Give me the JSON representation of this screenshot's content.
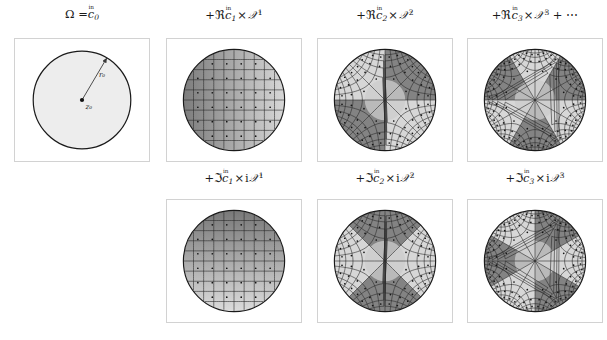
{
  "figure": {
    "background": "#ffffff",
    "panel_border_color": "#d2d2d2",
    "ink_color": "#1a1a1a"
  },
  "rows": [
    {
      "name": "real-part-row",
      "panels": [
        {
          "id": "omega-disk",
          "caption_parts": {
            "lead": "Ω =",
            "operator": "",
            "coefficient": "c",
            "coefficient_marker": "in",
            "coefficient_index": "0",
            "factor": "",
            "power": "",
            "trailer": ""
          },
          "caption_text": "Ω = c̊₀",
          "type": "domain",
          "annotations": {
            "center_label": "z₀",
            "radius_label": "r₀"
          },
          "fill": "#ededed",
          "grid": "none"
        },
        {
          "id": "re-c1-z1",
          "caption_text": "+ℜc̊₁ × 𝒵¹",
          "caption_parts": {
            "lead": "+",
            "operator": "ℜ",
            "coefficient": "c",
            "coefficient_marker": "in",
            "coefficient_index": "1",
            "factor": "",
            "power": "1",
            "trailer": ""
          },
          "type": "conformal",
          "order": 1,
          "imaginary": false,
          "gradient_direction": "horizontal",
          "gradient_dark": "#6e6e6e",
          "gradient_light": "#e6e6e6"
        },
        {
          "id": "re-c2-z2",
          "caption_text": "+ℜc̊₂ × 𝒵²",
          "caption_parts": {
            "lead": "+",
            "operator": "ℜ",
            "coefficient": "c",
            "coefficient_marker": "in",
            "coefficient_index": "2",
            "factor": "",
            "power": "2",
            "trailer": ""
          },
          "type": "conformal",
          "order": 2,
          "imaginary": false,
          "gradient_direction": "radial2",
          "gradient_dark": "#6e6e6e",
          "gradient_light": "#e6e6e6"
        },
        {
          "id": "re-c3-z3",
          "caption_text": "+ℜc̊₃ × 𝒵³ + ⋯",
          "caption_parts": {
            "lead": "+",
            "operator": "ℜ",
            "coefficient": "c",
            "coefficient_marker": "in",
            "coefficient_index": "3",
            "factor": "",
            "power": "3",
            "trailer": "+ ⋯"
          },
          "type": "conformal",
          "order": 3,
          "imaginary": false,
          "gradient_direction": "radial3",
          "gradient_dark": "#6e6e6e",
          "gradient_light": "#e6e6e6"
        }
      ]
    },
    {
      "name": "imaginary-part-row",
      "panels": [
        {
          "id": "im-spacer",
          "caption_text": "",
          "type": "empty"
        },
        {
          "id": "im-c1-iz1",
          "caption_text": "+ℑc̊₁ × i𝒵¹",
          "caption_parts": {
            "lead": "+",
            "operator": "ℑ",
            "coefficient": "c",
            "coefficient_marker": "in",
            "coefficient_index": "1",
            "factor": "i",
            "power": "1",
            "trailer": ""
          },
          "type": "conformal",
          "order": 1,
          "imaginary": true,
          "gradient_direction": "vertical",
          "gradient_dark": "#6e6e6e",
          "gradient_light": "#e6e6e6"
        },
        {
          "id": "im-c2-iz2",
          "caption_text": "+ℑc̊₂ × i𝒵²",
          "caption_parts": {
            "lead": "+",
            "operator": "ℑ",
            "coefficient": "c",
            "coefficient_marker": "in",
            "coefficient_index": "2",
            "factor": "i",
            "power": "2",
            "trailer": ""
          },
          "type": "conformal",
          "order": 2,
          "imaginary": true,
          "gradient_direction": "radial2r",
          "gradient_dark": "#6e6e6e",
          "gradient_light": "#e6e6e6"
        },
        {
          "id": "im-c3-iz3",
          "caption_text": "+ℑc̊₃ × i𝒵³",
          "caption_parts": {
            "lead": "+",
            "operator": "ℑ",
            "coefficient": "c",
            "coefficient_marker": "in",
            "coefficient_index": "3",
            "factor": "i",
            "power": "3",
            "trailer": ""
          },
          "type": "conformal",
          "order": 3,
          "imaginary": true,
          "gradient_direction": "radial3r",
          "gradient_dark": "#6e6e6e",
          "gradient_light": "#e6e6e6"
        }
      ]
    }
  ],
  "layout": {
    "panel_width": 136,
    "panel_height": 124,
    "columns_x": [
      14,
      166,
      317,
      467
    ],
    "row1_panel_y": 38,
    "row2_panel_y": 199,
    "row1_caption_y": 9,
    "row2_caption_y": 172,
    "disk_radius_fraction": 0.42
  }
}
